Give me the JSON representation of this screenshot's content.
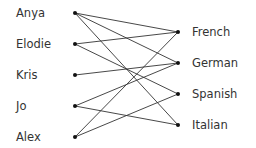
{
  "diagram": {
    "type": "bipartite-graph",
    "colors": {
      "line": "#333333",
      "node": "#111111",
      "text": "#333333",
      "background": "#ffffff"
    },
    "left_nodes": [
      {
        "id": "anya",
        "label": "Anya",
        "x": 75,
        "y": 13
      },
      {
        "id": "elodie",
        "label": "Elodie",
        "x": 75,
        "y": 44
      },
      {
        "id": "kris",
        "label": "Kris",
        "x": 75,
        "y": 75
      },
      {
        "id": "jo",
        "label": "Jo",
        "x": 75,
        "y": 106
      },
      {
        "id": "alex",
        "label": "Alex",
        "x": 75,
        "y": 137
      }
    ],
    "right_nodes": [
      {
        "id": "french",
        "label": "French",
        "x": 178,
        "y": 32
      },
      {
        "id": "german",
        "label": "German",
        "x": 178,
        "y": 63
      },
      {
        "id": "spanish",
        "label": "Spanish",
        "x": 178,
        "y": 94
      },
      {
        "id": "italian",
        "label": "Italian",
        "x": 178,
        "y": 125
      }
    ],
    "edges": [
      [
        "anya",
        "french"
      ],
      [
        "anya",
        "german"
      ],
      [
        "anya",
        "italian"
      ],
      [
        "elodie",
        "french"
      ],
      [
        "elodie",
        "spanish"
      ],
      [
        "kris",
        "german"
      ],
      [
        "jo",
        "german"
      ],
      [
        "jo",
        "italian"
      ],
      [
        "alex",
        "french"
      ],
      [
        "alex",
        "spanish"
      ]
    ]
  }
}
